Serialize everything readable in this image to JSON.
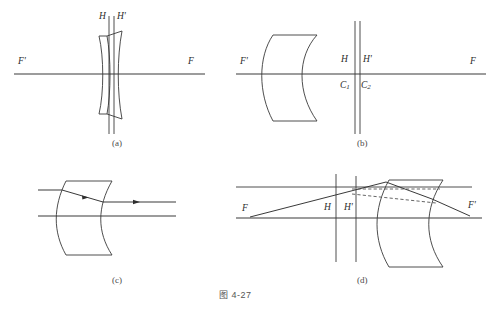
{
  "figure": {
    "caption": "图 4-27",
    "caption_x": 219,
    "caption_y": 292
  },
  "panels": [
    {
      "id": "a",
      "tag": "(a)",
      "tag_x": 113,
      "tag_y": 140,
      "description": "thin meniscus lens with principal planes H and H' close together near the lens",
      "labels": [
        {
          "name": "label-f-prime-left",
          "text": "F'",
          "x": 18,
          "y": 63
        },
        {
          "name": "label-f-right",
          "text": "F",
          "x": 188,
          "y": 63
        },
        {
          "name": "label-h",
          "text": "H",
          "x": 101,
          "y": 14
        },
        {
          "name": "label-h-prime",
          "text": "H'",
          "x": 118,
          "y": 14
        }
      ]
    },
    {
      "id": "b",
      "tag": "(b)",
      "tag_x": 358,
      "tag_y": 140,
      "description": "negative meniscus lens at left with principal planes H, H' and centers of curvature C1, C2 to the right",
      "labels": [
        {
          "name": "label-f-prime-left",
          "text": "F'",
          "x": 241,
          "y": 63
        },
        {
          "name": "label-f-right",
          "text": "F",
          "x": 470,
          "y": 63
        },
        {
          "name": "label-h",
          "text": "H",
          "x": 342,
          "y": 57
        },
        {
          "name": "label-h-prime",
          "text": "H'",
          "x": 363,
          "y": 57
        },
        {
          "name": "label-c1",
          "text": "C",
          "sub": "1",
          "x": 341,
          "y": 84
        },
        {
          "name": "label-c2",
          "text": "C",
          "sub": "2",
          "x": 362,
          "y": 84
        }
      ]
    },
    {
      "id": "c",
      "tag": "(c)",
      "tag_x": 113,
      "tag_y": 277,
      "description": "thick meniscus lens with a horizontal incident ray that is displaced downward inside the glass and exits parallel",
      "labels": []
    },
    {
      "id": "d",
      "tag": "(d)",
      "tag_x": 358,
      "tag_y": 277,
      "description": "thick meniscus lens with ray from F, principal planes H and H', dashed construction lines, and emergent ray to F'",
      "labels": [
        {
          "name": "label-f-left",
          "text": "F",
          "x": 243,
          "y": 205
        },
        {
          "name": "label-f-prime-right",
          "text": "F'",
          "x": 468,
          "y": 203
        },
        {
          "name": "label-h",
          "text": "H",
          "x": 325,
          "y": 204
        },
        {
          "name": "label-h-prime",
          "text": "H'",
          "x": 345,
          "y": 204
        }
      ]
    }
  ],
  "colors": {
    "ink": "#3a3a3a",
    "ray": "#2e2e2e",
    "label": "#2b2b2b",
    "background": "#ffffff"
  }
}
